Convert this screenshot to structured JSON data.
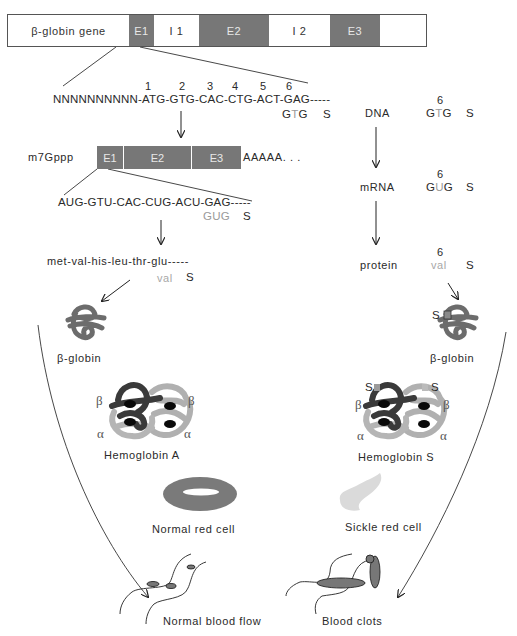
{
  "gene": {
    "label": "β-globin gene",
    "segments": [
      {
        "name": "E1",
        "type": "exon",
        "width": 25
      },
      {
        "name": "I 1",
        "type": "intron",
        "width": 45
      },
      {
        "name": "E2",
        "type": "exon",
        "width": 70
      },
      {
        "name": "I 2",
        "type": "intron",
        "width": 61
      },
      {
        "name": "E3",
        "type": "exon",
        "width": 50
      },
      {
        "name": "",
        "type": "intron",
        "width": 48
      }
    ]
  },
  "dna": {
    "codon_numbers": [
      "1",
      "2",
      "3",
      "4",
      "5",
      "6"
    ],
    "sequence": "NNNNNNNNNN-ATG-GTG-CAC-CTG-ACT-GAG-----",
    "mutant_codon": {
      "pre": "G",
      "mut": "T",
      "post": "G"
    },
    "mutant_label": "S"
  },
  "mrna": {
    "cap": "m7Gppp",
    "exons": [
      {
        "name": "E1",
        "width": 25
      },
      {
        "name": "E2",
        "width": 70
      },
      {
        "name": "E3",
        "width": 50
      }
    ],
    "tail": "AAAAA. . .",
    "sequence": "AUG-GTU-CAC-CUG-ACU-GAG-----",
    "mutant_codon": "GUG",
    "mutant_label": "S"
  },
  "protein": {
    "sequence": "met-val-his-leu-thr-glu-----",
    "mutant_residue": "val",
    "mutant_label": "S"
  },
  "summary": {
    "dna": {
      "label": "DNA",
      "position": "6",
      "codon_pre": "G",
      "codon_mut": "T",
      "codon_post": "G",
      "variant": "S"
    },
    "mrna": {
      "label": "mRNA",
      "position": "6",
      "codon_pre": "G",
      "codon_mut": "U",
      "codon_post": "G",
      "variant": "S"
    },
    "protein": {
      "label": "protein",
      "position": "6",
      "residue": "val",
      "variant": "S"
    }
  },
  "normal": {
    "globin_label": "β-globin",
    "hemoglobin_label": "Hemoglobin A",
    "cell_label": "Normal red cell",
    "flow_label": "Normal blood flow",
    "subunits": {
      "beta": "β",
      "alpha": "α"
    }
  },
  "sickle": {
    "globin_label": "β-globin",
    "globin_marker": "S",
    "hemoglobin_label": "Hemoglobin S",
    "hemoglobin_markers": [
      "S",
      "S"
    ],
    "cell_label": "Sickle red cell",
    "flow_label": "Blood clots",
    "subunits": {
      "beta": "β",
      "alpha": "α"
    }
  },
  "colors": {
    "exon": "#777777",
    "globin_dark": "#3d3d3d",
    "globin_mid": "#6f6f6f",
    "globin_light": "#b5b5b5",
    "normal_cell": "#7a7a7a",
    "sickle_cell": "#d9d9d9",
    "mutation_text": "#9a9a9a"
  }
}
